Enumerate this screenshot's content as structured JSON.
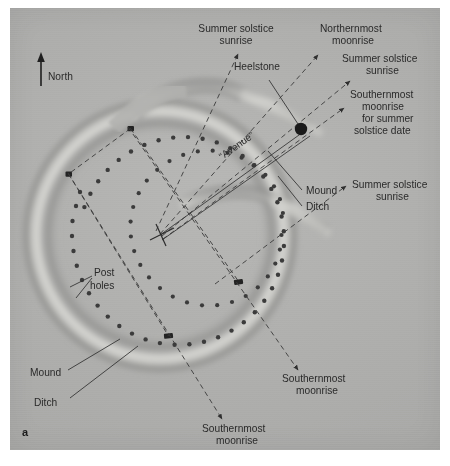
{
  "figure": {
    "panel_letter": "a",
    "background_color": "#adadab",
    "ink_color": "#2a2a2a"
  },
  "compass": {
    "label": "North",
    "icon": "north-arrow-icon"
  },
  "labels": {
    "summer_solstice_sunrise_top": "Summer solstice\nsunrise",
    "heelstone": "Heelstone",
    "northernmost_moonrise": "Northernmost\nmoonrise",
    "summer_solstice_sunrise_upper_right": "Summer solstice\nsunrise",
    "southernmost_moonrise_solstice": "Southernmost\nmoonrise\nfor summer\nsolstice date",
    "mound_right": "Mound",
    "ditch_right": "Ditch",
    "summer_solstice_sunrise_right": "Summer solstice\nsunrise",
    "southernmost_moonrise_right": "Southernmost\nmoonrise",
    "southernmost_moonrise_bottom": "Southernmost\nmoonrise",
    "post_holes": "Post\nholes",
    "mound_left": "Mound",
    "ditch_left": "Ditch",
    "avenue": "“Avenue”"
  },
  "label_lines": {
    "summer_solstice_sunrise_top_l1": "Summer solstice",
    "summer_solstice_sunrise_top_l2": "sunrise",
    "northernmost_moonrise_l1": "Northernmost",
    "northernmost_moonrise_l2": "moonrise",
    "ssr_upper_right_l1": "Summer solstice",
    "ssr_upper_right_l2": "sunrise",
    "southernmost_solstice_l1": "Southernmost",
    "southernmost_solstice_l2": "moonrise",
    "southernmost_solstice_l3": "for summer",
    "southernmost_solstice_l4": "solstice date",
    "ssr_right_l1": "Summer solstice",
    "ssr_right_l2": "sunrise",
    "southernmost_right_l1": "Southernmost",
    "southernmost_right_l2": "moonrise",
    "southernmost_bottom_l1": "Southernmost",
    "southernmost_bottom_l2": "moonrise",
    "post_holes_l1": "Post",
    "post_holes_l2": "holes"
  },
  "features": {
    "heelstone_marker": "heelstone-dot",
    "centre_marker": "monument-centre-cross",
    "station_stones": 4,
    "aubrey_holes_count": 56,
    "earthwork": [
      "bank",
      "ditch",
      "avenue-causeway"
    ]
  },
  "alignments": [
    {
      "name": "summer-solstice-sunrise-north",
      "style": "dashed"
    },
    {
      "name": "northernmost-moonrise",
      "style": "dashed"
    },
    {
      "name": "summer-solstice-sunrise-heelstone",
      "style": "dashed"
    },
    {
      "name": "southernmost-moonrise-for-summer-solstice",
      "style": "dashed"
    },
    {
      "name": "summer-solstice-sunrise-east",
      "style": "dashed"
    },
    {
      "name": "southernmost-moonrise-southeast",
      "style": "dashed"
    },
    {
      "name": "southernmost-moonrise-south",
      "style": "dashed"
    },
    {
      "name": "avenue-axis",
      "style": "solid"
    }
  ]
}
